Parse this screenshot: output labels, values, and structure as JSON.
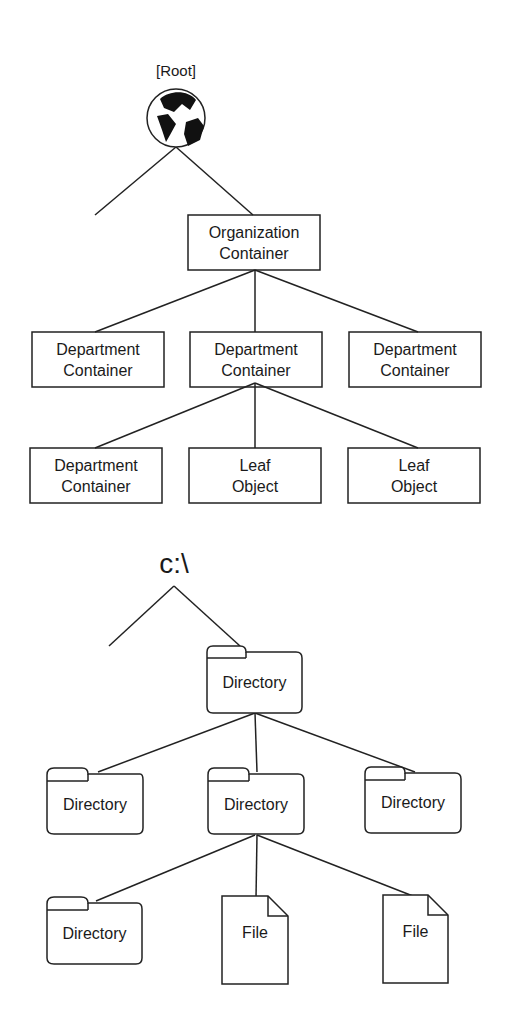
{
  "top_tree": {
    "root_label": "[Root]",
    "root_icon": "globe-icon",
    "org": {
      "line1": "Organization",
      "line2": "Container"
    },
    "level2": [
      {
        "line1": "Department",
        "line2": "Container"
      },
      {
        "line1": "Department",
        "line2": "Container"
      },
      {
        "line1": "Department",
        "line2": "Container"
      }
    ],
    "level3": [
      {
        "line1": "Department",
        "line2": "Container"
      },
      {
        "line1": "Leaf",
        "line2": "Object"
      },
      {
        "line1": "Leaf",
        "line2": "Object"
      }
    ]
  },
  "bottom_tree": {
    "root_label": "c:\\",
    "dir": "Directory",
    "level2": [
      "Directory",
      "Directory",
      "Directory"
    ],
    "level3": [
      "Directory",
      "File",
      "File"
    ]
  }
}
